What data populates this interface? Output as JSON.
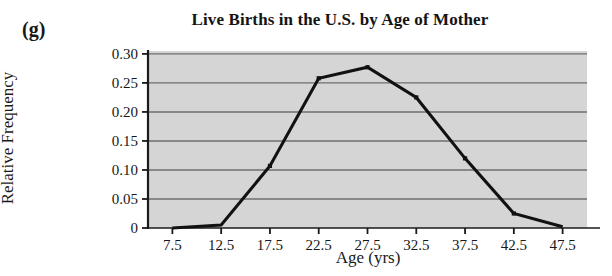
{
  "figure": {
    "panel_label": "(g)",
    "title": "Live Births in the U.S. by Age of Mother",
    "xlabel": "Age (yrs)",
    "ylabel": "Relative Frequency"
  },
  "colors": {
    "plot_background": "#d5d5d5",
    "gridline": "#6e6e6e",
    "axis": "#1a1a1a",
    "series_line": "#111111",
    "page_background": "#ffffff",
    "text": "#171717"
  },
  "chart_data": {
    "type": "line",
    "title": "Live Births in the U.S. by Age of Mother",
    "xlabel": "Age (yrs)",
    "ylabel": "Relative Frequency",
    "x": [
      7.5,
      12.5,
      17.5,
      22.5,
      27.5,
      32.5,
      37.5,
      42.5,
      47.5
    ],
    "values": [
      0.0,
      0.005,
      0.107,
      0.258,
      0.277,
      0.225,
      0.12,
      0.025,
      0.002
    ],
    "xlim": [
      5.0,
      50.0
    ],
    "ylim": [
      0.0,
      0.305
    ],
    "xticks": [
      7.5,
      12.5,
      17.5,
      22.5,
      27.5,
      32.5,
      37.5,
      42.5,
      47.5
    ],
    "xtick_labels": [
      "7.5",
      "12.5",
      "17.5",
      "22.5",
      "27.5",
      "32.5",
      "37.5",
      "42.5",
      "47.5"
    ],
    "yticks": [
      0,
      0.05,
      0.1,
      0.15,
      0.2,
      0.25,
      0.3
    ],
    "ytick_labels": [
      "0",
      "0.05",
      "0.10",
      "0.15",
      "0.20",
      "0.25",
      "0.30"
    ],
    "grid": "horizontal",
    "legend": "none",
    "markers": "filled-square"
  }
}
